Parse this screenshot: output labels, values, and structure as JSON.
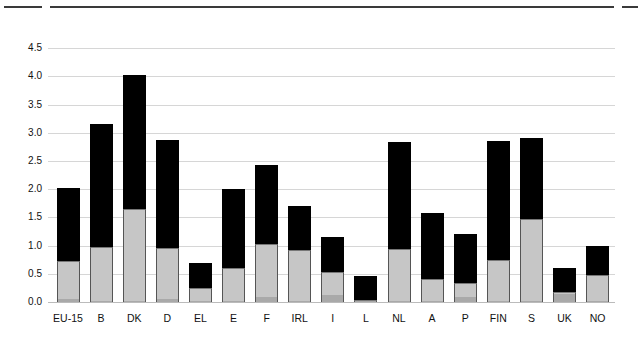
{
  "chart_data": {
    "type": "bar",
    "stacked": true,
    "title": "",
    "xlabel": "",
    "ylabel": "",
    "ylim": [
      0,
      4.5
    ],
    "yticks": [
      "0.0",
      "0.5",
      "1.0",
      "1.5",
      "2.0",
      "2.5",
      "3.0",
      "3.5",
      "4.0",
      "4.5"
    ],
    "grid": true,
    "legend": "none visible",
    "categories": [
      "EU-15",
      "B",
      "DK",
      "D",
      "EL",
      "E",
      "F",
      "IRL",
      "I",
      "L",
      "NL",
      "A",
      "P",
      "FIN",
      "S",
      "UK",
      "NO"
    ],
    "series": [
      {
        "name": "bottom segment (dark grey)",
        "color": "#a9a9a9",
        "values": [
          0.05,
          0.02,
          0.02,
          0.05,
          0.02,
          0.02,
          0.09,
          0.02,
          0.13,
          0.01,
          0.02,
          0.02,
          0.09,
          0.02,
          0.02,
          0.14,
          0.02
        ]
      },
      {
        "name": "middle segment (light grey)",
        "color": "#c6c6c6",
        "values": [
          0.68,
          0.95,
          1.63,
          0.9,
          0.22,
          0.59,
          0.94,
          0.91,
          0.41,
          0.02,
          0.92,
          0.38,
          0.24,
          0.72,
          1.46,
          0.04,
          0.46
        ]
      },
      {
        "name": "top segment (black)",
        "color": "#000000",
        "values": [
          1.29,
          2.18,
          2.38,
          1.92,
          0.46,
          1.39,
          1.4,
          0.78,
          0.62,
          0.43,
          1.89,
          1.18,
          0.88,
          2.11,
          1.42,
          0.43,
          0.52
        ]
      }
    ],
    "totals": [
      2.02,
      3.15,
      4.03,
      2.87,
      0.7,
      2.0,
      2.43,
      1.71,
      1.16,
      0.46,
      2.83,
      1.58,
      1.21,
      2.85,
      2.9,
      0.61,
      1.0
    ]
  },
  "colors": {
    "rule": "#3a3a3a",
    "grid": "#d6d6d6"
  }
}
